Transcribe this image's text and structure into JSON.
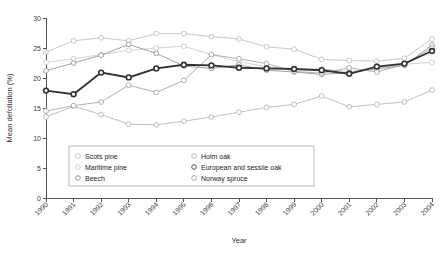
{
  "chart_data": {
    "type": "line",
    "title": "",
    "xlabel": "Year",
    "ylabel": "Mean defoliation (%)",
    "x": [
      1990,
      1991,
      1992,
      1993,
      1994,
      1995,
      1996,
      1997,
      1998,
      1999,
      2000,
      2001,
      2002,
      2003,
      2004
    ],
    "categories": [
      "1990",
      "1991",
      "1992",
      "1993",
      "1994",
      "1995",
      "1996",
      "1997",
      "1998",
      "1999",
      "2000",
      "2001",
      "2002",
      "2003",
      "2004"
    ],
    "xlim": [
      1990,
      2004
    ],
    "ylim": [
      0,
      30
    ],
    "yticks": [
      0,
      5,
      10,
      15,
      20,
      25,
      30
    ],
    "grid": false,
    "legend_position": "inside-bottom-left",
    "series": [
      {
        "name": "Scots pine",
        "color": "#b9b9b9",
        "bold": false,
        "values": [
          24.3,
          26.2,
          26.7,
          26.2,
          27.4,
          27.4,
          26.9,
          26.5,
          25.2,
          24.8,
          23.1,
          22.9,
          22.8,
          23.3,
          26.5
        ]
      },
      {
        "name": "Maritime pine",
        "color": "#c8c8c8",
        "bold": false,
        "values": [
          22.6,
          23.2,
          23.9,
          24.6,
          25.0,
          25.3,
          23.9,
          22.7,
          21.9,
          21.4,
          21.5,
          21.1,
          21.6,
          22.3,
          22.6
        ]
      },
      {
        "name": "Beech",
        "color": "#8a8a8a",
        "bold": false,
        "values": [
          21.2,
          22.5,
          23.8,
          25.6,
          24.1,
          22.0,
          21.6,
          22.2,
          21.3,
          21.0,
          20.6,
          20.9,
          21.5,
          22.1,
          25.5
        ]
      },
      {
        "name": "Holm oak",
        "color": "#aeaeae",
        "bold": false,
        "values": [
          13.5,
          15.3,
          13.9,
          12.3,
          12.2,
          12.8,
          13.5,
          14.3,
          15.1,
          15.6,
          17.0,
          15.2,
          15.6,
          16.0,
          18.0
        ]
      },
      {
        "name": "European and sessile oak",
        "color": "#333333",
        "bold": true,
        "values": [
          17.9,
          17.3,
          20.9,
          20.1,
          21.6,
          22.2,
          22.1,
          21.7,
          21.6,
          21.5,
          21.3,
          20.7,
          21.9,
          22.4,
          24.5
        ]
      },
      {
        "name": "Norway spruce",
        "color": "#9d9d9d",
        "bold": false,
        "values": [
          14.5,
          15.4,
          16.0,
          18.8,
          17.6,
          19.6,
          23.9,
          23.2,
          22.4,
          21.1,
          20.8,
          21.7,
          21.0,
          22.3,
          25.0
        ]
      }
    ]
  },
  "legend": {
    "items": [
      {
        "label": "Scots pine"
      },
      {
        "label": "Holm oak"
      },
      {
        "label": "Maritime pine"
      },
      {
        "label": "European and sessile oak"
      },
      {
        "label": "Beech"
      },
      {
        "label": "Norway spruce"
      }
    ]
  }
}
